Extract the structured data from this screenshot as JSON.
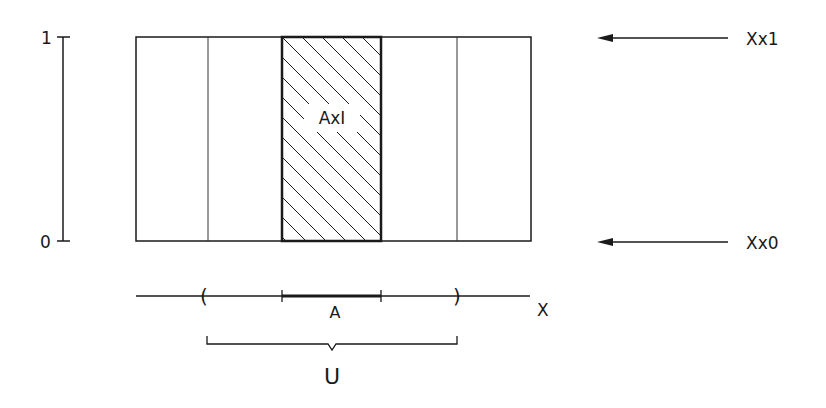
{
  "diagram": {
    "type": "product-neighborhood",
    "y_axis": {
      "label_top": "1",
      "label_bottom": "0"
    },
    "product_box": {
      "hatched_region_label": "AxI"
    },
    "right_labels": {
      "top_fiber": "Xx1",
      "bottom_fiber": "Xx0"
    },
    "x_axis": {
      "label": "X",
      "open_paren": "(",
      "close_paren": ")",
      "subset_label": "A",
      "neighborhood_label": "U"
    },
    "colors": {
      "stroke": "#1a1a1a",
      "background": "#ffffff"
    }
  }
}
